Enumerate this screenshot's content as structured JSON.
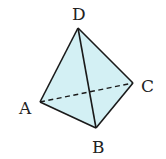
{
  "diagram": {
    "type": "tetrahedron",
    "colors": {
      "face_fill": "#d3f0f4",
      "edge": "#1a1a1a",
      "background": "#ffffff"
    },
    "vertices": {
      "A": {
        "label": "A",
        "x": 40,
        "y": 102,
        "label_x": 20,
        "label_y": 114
      },
      "B": {
        "label": "B",
        "x": 96,
        "y": 128,
        "label_x": 92,
        "label_y": 153
      },
      "C": {
        "label": "C",
        "x": 133,
        "y": 83,
        "label_x": 141,
        "label_y": 92
      },
      "D": {
        "label": "D",
        "x": 78,
        "y": 28,
        "label_x": 72,
        "label_y": 20
      }
    },
    "edges": [
      {
        "from": "D",
        "to": "A",
        "style": "solid"
      },
      {
        "from": "D",
        "to": "B",
        "style": "solid"
      },
      {
        "from": "D",
        "to": "C",
        "style": "solid"
      },
      {
        "from": "A",
        "to": "B",
        "style": "solid"
      },
      {
        "from": "B",
        "to": "C",
        "style": "solid"
      },
      {
        "from": "A",
        "to": "C",
        "style": "dashed"
      }
    ]
  }
}
